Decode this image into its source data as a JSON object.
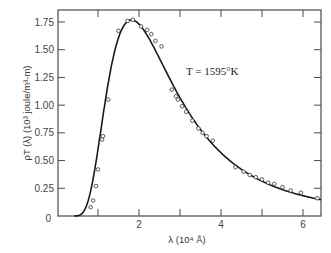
{
  "chart_data": {
    "type": "line",
    "title": "",
    "xlabel": "λ (10⁴ Å)",
    "ylabel": "ρT (λ) (10³ joule/m³-m)",
    "xlim": [
      0,
      6.44
    ],
    "ylim": [
      0,
      1.75
    ],
    "x_ticks": [
      1,
      2,
      3,
      4,
      5,
      6
    ],
    "x_tick_labels": [
      "",
      "2",
      "",
      "4",
      "",
      "6"
    ],
    "y_ticks": [
      0,
      0.25,
      0.5,
      0.75,
      1.0,
      1.25,
      1.5,
      1.75
    ],
    "y_tick_labels": [
      "0",
      "0.25",
      "0.50",
      "0.75",
      "1.00",
      "1.25",
      "1.50",
      "1.75"
    ],
    "grid": false,
    "legend": null,
    "annotations": [
      {
        "text": "T = 1595°K",
        "x": 3.0,
        "y": 1.42
      }
    ],
    "series": [
      {
        "name": "Planck formula (T = 1595 K)",
        "style": "solid-line",
        "x": [
          0.4,
          0.5,
          0.6,
          0.75,
          0.9,
          1.0,
          1.1,
          1.25,
          1.4,
          1.5,
          1.65,
          1.82,
          2.0,
          2.25,
          2.5,
          2.75,
          3.0,
          3.25,
          3.5,
          3.75,
          4.0,
          4.5,
          5.0,
          5.5,
          6.0,
          6.44
        ],
        "y": [
          0.0,
          0.002,
          0.02,
          0.126,
          0.4,
          0.604,
          0.82,
          1.2,
          1.48,
          1.607,
          1.72,
          1.768,
          1.731,
          1.59,
          1.42,
          1.24,
          1.07,
          0.915,
          0.78,
          0.665,
          0.569,
          0.419,
          0.314,
          0.238,
          0.183,
          0.15
        ]
      },
      {
        "name": "Experimental data",
        "style": "open-circles",
        "x": [
          0.82,
          0.88,
          0.95,
          1.0,
          1.1,
          1.12,
          1.25,
          1.5,
          1.72,
          1.85,
          2.05,
          2.2,
          2.3,
          2.4,
          2.55,
          2.8,
          2.9,
          2.95,
          3.05,
          3.15,
          3.3,
          3.45,
          3.55,
          3.65,
          3.8,
          4.35,
          4.55,
          4.7,
          4.85,
          5.0,
          5.15,
          5.3,
          5.5,
          5.7,
          5.95,
          6.35
        ],
        "y": [
          0.08,
          0.14,
          0.27,
          0.42,
          0.69,
          0.72,
          1.05,
          1.67,
          1.76,
          1.77,
          1.71,
          1.68,
          1.64,
          1.58,
          1.53,
          1.14,
          1.08,
          1.05,
          0.99,
          0.94,
          0.86,
          0.79,
          0.75,
          0.72,
          0.68,
          0.44,
          0.4,
          0.37,
          0.35,
          0.33,
          0.3,
          0.29,
          0.26,
          0.23,
          0.21,
          0.16
        ]
      }
    ]
  },
  "labels": {
    "xlabel": "λ (10⁴ Å)",
    "ylabel": "ρT (λ) (10³ joule/m³-m)",
    "annotation": "T = 1595°K"
  }
}
